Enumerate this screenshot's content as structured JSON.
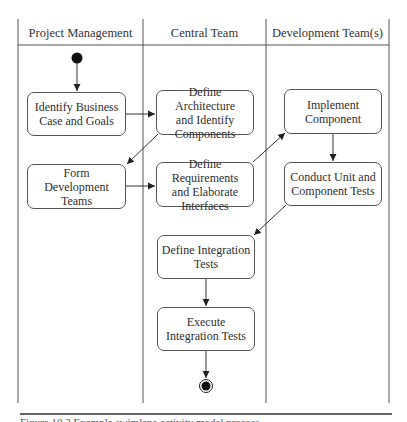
{
  "diagram": {
    "type": "UML activity diagram with swimlanes",
    "lanes": [
      {
        "id": "pm",
        "title": "Project Management"
      },
      {
        "id": "central",
        "title": "Central Team"
      },
      {
        "id": "dev",
        "title": "Development Team(s)"
      }
    ],
    "nodes": [
      {
        "id": "start",
        "kind": "initial",
        "lane": "pm"
      },
      {
        "id": "n1",
        "kind": "activity",
        "lane": "pm",
        "label": "Identify Business\nCase and Goals"
      },
      {
        "id": "n2",
        "kind": "activity",
        "lane": "central",
        "label": "Define Architecture\nand Identify\nComponents"
      },
      {
        "id": "n3",
        "kind": "activity",
        "lane": "pm",
        "label": "Form Development\nTeams"
      },
      {
        "id": "n4",
        "kind": "activity",
        "lane": "central",
        "label": "Define Requirements\nand Elaborate\nInterfaces"
      },
      {
        "id": "n5",
        "kind": "activity",
        "lane": "dev",
        "label": "Implement\nComponent"
      },
      {
        "id": "n6",
        "kind": "activity",
        "lane": "dev",
        "label": "Conduct Unit and\nComponent Tests"
      },
      {
        "id": "n7",
        "kind": "activity",
        "lane": "central",
        "label": "Define Integration\nTests"
      },
      {
        "id": "n8",
        "kind": "activity",
        "lane": "central",
        "label": "Execute\nIntegration Tests"
      },
      {
        "id": "end",
        "kind": "final",
        "lane": "central"
      }
    ],
    "edges": [
      {
        "from": "start",
        "to": "n1"
      },
      {
        "from": "n1",
        "to": "n2"
      },
      {
        "from": "n2",
        "to": "n3"
      },
      {
        "from": "n3",
        "to": "n4"
      },
      {
        "from": "n4",
        "to": "n5"
      },
      {
        "from": "n5",
        "to": "n6"
      },
      {
        "from": "n6",
        "to": "n7"
      },
      {
        "from": "n7",
        "to": "n8"
      },
      {
        "from": "n8",
        "to": "end"
      }
    ]
  },
  "caption": {
    "text": "Figure 10.3   Example swimlane activity model process"
  },
  "colors": {
    "line": "#555555",
    "node_fill": "#111111",
    "background": "#ffffff"
  }
}
